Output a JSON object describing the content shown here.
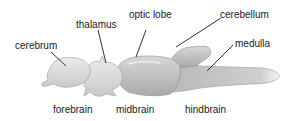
{
  "diagram": {
    "labels": {
      "cerebrum": "cerebrum",
      "thalamus": "thalamus",
      "optic_lobe": "optic lobe",
      "cerebellum": "cerebellum",
      "medulla": "medulla"
    },
    "regions": {
      "forebrain": "forebrain",
      "midbrain": "midbrain",
      "hindbrain": "hindbrain"
    }
  }
}
